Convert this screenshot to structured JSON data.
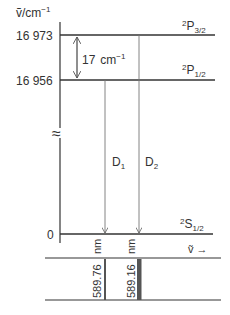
{
  "axis": {
    "label_symbol": "ṽ",
    "label_unit": "/cm",
    "label_exp": "−1",
    "ticks": [
      {
        "label": "16 973",
        "y": 35
      },
      {
        "label": "16 956",
        "y": 80
      },
      {
        "label": "0",
        "y": 234
      }
    ],
    "break_symbol": "≈"
  },
  "levels": [
    {
      "term_sup": "2",
      "term_main": "P",
      "term_sub": "3/2",
      "energy": "16 973"
    },
    {
      "term_sup": "2",
      "term_main": "P",
      "term_sub": "1/2",
      "energy": "16 956"
    },
    {
      "term_sup": "2",
      "term_main": "S",
      "term_sub": "1/2",
      "energy": "0"
    }
  ],
  "splitting": {
    "value": "17",
    "unit": "cm",
    "exp": "−1"
  },
  "transitions": [
    {
      "name": "D",
      "sub": "1",
      "wavelength": "589.76",
      "unit": "nm"
    },
    {
      "name": "D",
      "sub": "2",
      "wavelength": "589.16",
      "unit": "nm"
    }
  ],
  "spectrum": {
    "axis_symbol": "ṽ",
    "arrow": "→"
  },
  "colors": {
    "line": "#333333",
    "thin_line": "#777777",
    "bar": "#555555"
  }
}
